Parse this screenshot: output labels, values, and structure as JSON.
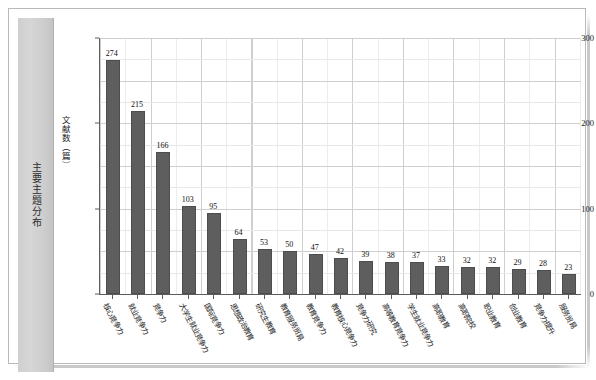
{
  "sidebar": {
    "title": "主要主题分布"
  },
  "chart_data": {
    "type": "bar",
    "title": "",
    "subtitle": "",
    "xlabel": "",
    "ylabel": "文献数（篇）",
    "ylim": [
      0,
      300
    ],
    "yticks": [
      0,
      100,
      200,
      300
    ],
    "grid": true,
    "legend": null,
    "orientation": "vertical",
    "bar_color": "#5e5e5e",
    "categories": [
      "核心竞争力",
      "就业竞争力",
      "竞争力",
      "大学生就业竞争力",
      "国际竞争力",
      "思想政治教育",
      "研究生教育",
      "教育服务贸易",
      "教育竞争力",
      "教育核心竞争力",
      "竞争力研究",
      "高等教育竞争力",
      "学生就业竞争力",
      "高职教育",
      "高职院校",
      "职业教育",
      "创业教育",
      "竞争力提升",
      "服务贸易"
    ],
    "values": [
      274,
      215,
      166,
      103,
      95,
      64,
      53,
      50,
      47,
      42,
      39,
      38,
      37,
      33,
      32,
      32,
      29,
      28,
      23
    ]
  }
}
